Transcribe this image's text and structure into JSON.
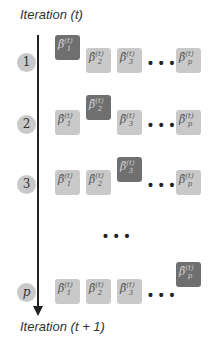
{
  "title_top": "Iteration (t)",
  "title_bottom": "Iteration (t + 1)",
  "ellipsis": "• • •",
  "colors": {
    "inactive_box": "#c9c9c9",
    "active_box": "#6f6f6f",
    "step_circle": "#c9c9c9",
    "axis": "#222222"
  },
  "coefficients": [
    {
      "symbol": "β̂",
      "sub": "1",
      "sup": "(t)"
    },
    {
      "symbol": "β̂",
      "sub": "2",
      "sup": "(t)"
    },
    {
      "symbol": "β̂",
      "sub": "3",
      "sup": "(t)"
    },
    {
      "symbol": "β̂",
      "sub": "p",
      "sup": "(t)"
    }
  ],
  "rows": [
    {
      "step": "1",
      "active_index": 0
    },
    {
      "step": "2",
      "active_index": 1
    },
    {
      "step": "3",
      "active_index": 2
    },
    {
      "step": "p",
      "active_index": 3
    }
  ],
  "vertical_ellipsis": "• • •"
}
